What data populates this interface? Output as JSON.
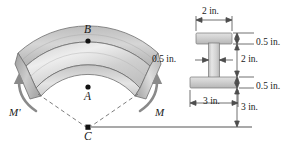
{
  "figure": {
    "type": "engineering-diagram",
    "colors": {
      "outline": "#6e6e6e",
      "beam_light": "#e8e8e8",
      "beam_mid": "#c9c9c9",
      "beam_dark": "#a8a8a8",
      "arrow": "#8a8a8a",
      "text": "#1a1a1a",
      "dim_line": "#4d4d4d",
      "dashed": "#6e6e6e"
    }
  },
  "beam": {
    "points": [
      {
        "id": "B",
        "label": "B"
      },
      {
        "id": "A",
        "label": "A"
      },
      {
        "id": "C",
        "label": "C"
      }
    ],
    "moments": [
      {
        "id": "M_prime",
        "label": "M'"
      },
      {
        "id": "M",
        "label": "M"
      }
    ]
  },
  "section": {
    "name": "I-beam-cross-section",
    "dimensions": [
      {
        "id": "top-flange-width",
        "label": "2 in."
      },
      {
        "id": "top-flange-thickness",
        "label": "0.5 in."
      },
      {
        "id": "web-thickness",
        "label": "0.5 in."
      },
      {
        "id": "web-height",
        "label": "2 in."
      },
      {
        "id": "bottom-flange-thickness",
        "label": "0.5 in."
      },
      {
        "id": "bottom-flange-width",
        "label": "3 in."
      },
      {
        "id": "radius-to-centroid",
        "label": "3 in."
      }
    ]
  }
}
